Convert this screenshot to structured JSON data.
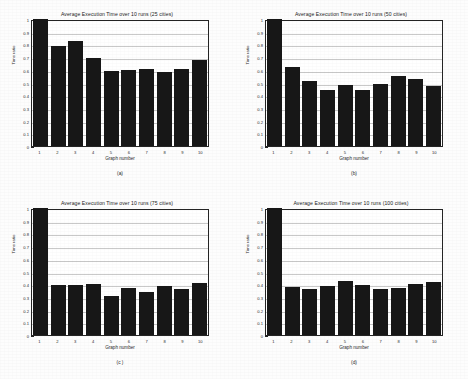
{
  "figure": {
    "background_color": "#fdfdfd",
    "bar_color": "#171717",
    "grid_color": "#c9c9c9",
    "axis_color": "#242424"
  },
  "panels": [
    {
      "caption": "(a)",
      "title": "Average Execution Time over 10 runs (25 cities)",
      "xlabel": "Graph number",
      "ylabel": "Time ratio"
    },
    {
      "caption": "(b)",
      "title": "Average Execution Time over 10 runs (50 cities)",
      "xlabel": "Graph number",
      "ylabel": "Time ratio"
    },
    {
      "caption": "(c )",
      "title": "Average Execution Time over 10 runs (75 cities)",
      "xlabel": "Graph number",
      "ylabel": "Time ratio"
    },
    {
      "caption": "(d)",
      "title": "Average Execution Time over 10 runs (100 cities)",
      "xlabel": "Graph number",
      "ylabel": "Time ratio"
    }
  ],
  "y_ticks": [
    "0",
    "0.1",
    "0.2",
    "0.3",
    "0.4",
    "0.5",
    "0.6",
    "0.7",
    "0.8",
    "0.9",
    "1"
  ],
  "x_ticks": [
    "1",
    "2",
    "3",
    "4",
    "5",
    "6",
    "7",
    "8",
    "9",
    "10"
  ],
  "chart_data": [
    {
      "type": "bar",
      "title": "Average Execution Time over 10 runs (25 cities)",
      "subtitle": "(a)",
      "xlabel": "Graph number",
      "ylabel": "Time ratio",
      "categories": [
        "1",
        "2",
        "3",
        "4",
        "5",
        "6",
        "7",
        "8",
        "9",
        "10"
      ],
      "values": [
        1.0,
        0.79,
        0.825,
        0.695,
        0.59,
        0.6,
        0.605,
        0.58,
        0.605,
        0.675
      ],
      "ylim": [
        0,
        1
      ],
      "ytick_step": 0.1,
      "grid": "horizontal",
      "legend": "none"
    },
    {
      "type": "bar",
      "title": "Average Execution Time over 10 runs (50 cities)",
      "subtitle": "(b)",
      "xlabel": "Graph number",
      "ylabel": "Time ratio",
      "categories": [
        "1",
        "2",
        "3",
        "4",
        "5",
        "6",
        "7",
        "8",
        "9",
        "10"
      ],
      "values": [
        1.0,
        0.62,
        0.515,
        0.445,
        0.48,
        0.44,
        0.49,
        0.555,
        0.525,
        0.475
      ],
      "ylim": [
        0,
        1
      ],
      "ytick_step": 0.1,
      "grid": "horizontal",
      "legend": "none"
    },
    {
      "type": "bar",
      "title": "Average Execution Time over 10 runs (75 cities)",
      "subtitle": "(c )",
      "xlabel": "Graph number",
      "ylabel": "Time ratio",
      "categories": [
        "1",
        "2",
        "3",
        "4",
        "5",
        "6",
        "7",
        "8",
        "9",
        "10"
      ],
      "values": [
        1.0,
        0.395,
        0.395,
        0.4,
        0.31,
        0.37,
        0.335,
        0.385,
        0.365,
        0.41
      ],
      "ylim": [
        0,
        1
      ],
      "ytick_step": 0.1,
      "grid": "horizontal",
      "legend": "none"
    },
    {
      "type": "bar",
      "title": "Average Execution Time over 10 runs (100 cities)",
      "subtitle": "(d)",
      "xlabel": "Graph number",
      "ylabel": "Time ratio",
      "categories": [
        "1",
        "2",
        "3",
        "4",
        "5",
        "6",
        "7",
        "8",
        "9",
        "10"
      ],
      "values": [
        1.0,
        0.38,
        0.36,
        0.385,
        0.425,
        0.395,
        0.36,
        0.37,
        0.4,
        0.42
      ],
      "ylim": [
        0,
        1
      ],
      "ytick_step": 0.1,
      "grid": "horizontal",
      "legend": "none"
    }
  ]
}
